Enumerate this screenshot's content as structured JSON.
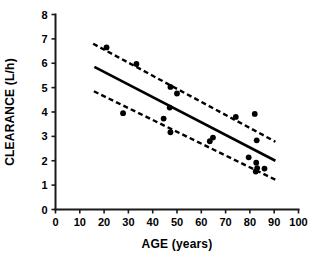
{
  "chart_data": {
    "type": "scatter",
    "title": "",
    "xlabel": "AGE (years)",
    "ylabel": "CLEARANCE (L/h)",
    "xlim": [
      0,
      100
    ],
    "ylim": [
      0,
      8
    ],
    "xticks": [
      0,
      10,
      20,
      30,
      40,
      50,
      60,
      70,
      80,
      90,
      100
    ],
    "yticks": [
      0,
      1,
      2,
      3,
      4,
      5,
      6,
      7,
      8
    ],
    "xtick_labels": [
      "0",
      "10",
      "20",
      "30",
      "40",
      "50",
      "60",
      "70",
      "80",
      "90",
      "100"
    ],
    "ytick_labels": [
      "0",
      "1",
      "2",
      "3",
      "4",
      "5",
      "6",
      "7",
      "8"
    ],
    "grid": false,
    "legend": false,
    "marker": "filled-circle",
    "marker_color": "#000000",
    "points": [
      {
        "x": 21.0,
        "y": 6.65
      },
      {
        "x": 33.3,
        "y": 5.97
      },
      {
        "x": 47.3,
        "y": 5.03
      },
      {
        "x": 50.0,
        "y": 4.76
      },
      {
        "x": 47.0,
        "y": 4.18
      },
      {
        "x": 44.5,
        "y": 3.73
      },
      {
        "x": 27.8,
        "y": 3.95
      },
      {
        "x": 47.3,
        "y": 3.17
      },
      {
        "x": 64.8,
        "y": 2.95
      },
      {
        "x": 63.5,
        "y": 2.8
      },
      {
        "x": 74.2,
        "y": 3.8
      },
      {
        "x": 82.0,
        "y": 3.92
      },
      {
        "x": 82.8,
        "y": 2.84
      },
      {
        "x": 79.5,
        "y": 2.14
      },
      {
        "x": 82.6,
        "y": 1.92
      },
      {
        "x": 83.0,
        "y": 1.7
      },
      {
        "x": 86.0,
        "y": 1.68
      },
      {
        "x": 82.4,
        "y": 1.56
      }
    ],
    "regression_line": {
      "name": "regression",
      "style": "solid",
      "x": [
        16.0,
        90.5
      ],
      "y": [
        5.85,
        2.0
      ]
    },
    "confidence_bands": [
      {
        "name": "upper-confidence-band",
        "style": "dashed",
        "x": [
          15.5,
          90.5
        ],
        "y": [
          6.8,
          2.78
        ]
      },
      {
        "name": "lower-confidence-band",
        "style": "dashed",
        "x": [
          15.8,
          90.5
        ],
        "y": [
          4.85,
          1.22
        ]
      }
    ]
  },
  "axes": {
    "x_title": "AGE (years)",
    "y_title": "CLEARANCE (L/h)"
  }
}
